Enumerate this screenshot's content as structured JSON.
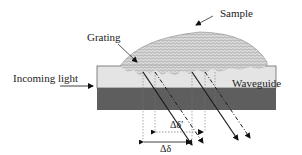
{
  "labels": {
    "sample": "Sample",
    "grating": "Grating",
    "incoming_light": "Incoming light",
    "waveguide": "Waveguide",
    "delta_delta_prime": "Δδ′",
    "delta_delta": "Δδ"
  },
  "colors": {
    "waveguide_fill": "#e4e4e4",
    "substrate_fill": "#5e5e5e",
    "sample_fill": "#d8d8d8",
    "outline": "#555555",
    "beam": "#1a1a1a"
  }
}
